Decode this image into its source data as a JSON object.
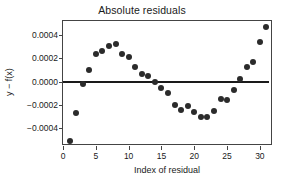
{
  "chart_data": {
    "type": "scatter",
    "title": "Absolute residuals",
    "xlabel": "Index of residual",
    "ylabel": "y − f(x)",
    "xlim": [
      0,
      32
    ],
    "ylim": [
      -0.00055,
      0.00052
    ],
    "xticks": [
      0,
      5,
      10,
      15,
      20,
      25,
      30
    ],
    "xtick_labels": [
      "0",
      "5",
      "10",
      "15",
      "20",
      "25",
      "30"
    ],
    "yticks": [
      0.0004,
      0.0002,
      0.0,
      -0.0002,
      -0.0004
    ],
    "ytick_labels": [
      "0.0004",
      "0.0002",
      "0.0000",
      "−0.0002",
      "−0.0004"
    ],
    "grid": false,
    "legend": "none",
    "reference_line": {
      "orientation": "horizontal",
      "y": 0.0,
      "color": "#1a1a1a"
    },
    "marker": {
      "shape": "circle",
      "color": "#2b2b2b",
      "size": 6
    },
    "x": [
      1,
      2,
      3,
      4,
      5,
      6,
      7,
      8,
      9,
      10,
      11,
      12,
      13,
      14,
      15,
      16,
      17,
      18,
      19,
      20,
      21,
      22,
      23,
      24,
      25,
      26,
      27,
      28,
      29,
      30,
      31
    ],
    "values": [
      -0.00051,
      -0.00027,
      -2e-05,
      0.0001,
      0.00024,
      0.00026,
      0.00031,
      0.00032,
      0.00024,
      0.00021,
      0.00013,
      7e-05,
      5e-05,
      0.0,
      -5e-05,
      -0.0001,
      -0.0002,
      -0.00024,
      -0.00021,
      -0.00026,
      -0.0003,
      -0.0003,
      -0.00025,
      -0.00015,
      -0.00016,
      -7e-05,
      2e-05,
      0.00013,
      0.00017,
      0.00034,
      0.00047
    ]
  }
}
